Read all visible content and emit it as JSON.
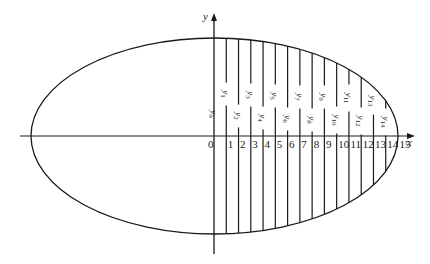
{
  "figure": {
    "type": "diagram",
    "axes": {
      "x_label": "x",
      "y_label": "y",
      "origin_label": "0"
    },
    "ellipse": {
      "cx": 214.5,
      "cy": 136,
      "rx": 183.5,
      "ry": 98
    },
    "ordinates": {
      "count": 15,
      "prefix": "y",
      "labels": [
        "y0",
        "y1",
        "y2",
        "y3",
        "y4",
        "y5",
        "y6",
        "y7",
        "y8",
        "y9",
        "y10",
        "y11",
        "y12",
        "y13",
        "y14"
      ]
    },
    "tick_labels": [
      "0",
      "1",
      "2",
      "3",
      "4",
      "5",
      "6",
      "7",
      "8",
      "9",
      "10",
      "11",
      "12",
      "13",
      "14",
      "15"
    ],
    "colors": {
      "stroke": "#1a1a1a",
      "background": "#ffffff"
    }
  }
}
